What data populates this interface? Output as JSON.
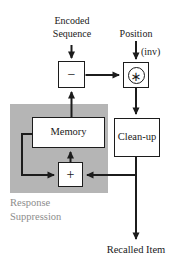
{
  "labels": {
    "encoded_sequence": "Encoded Sequence",
    "position": "Position",
    "inv": "(inv)",
    "response_suppression": "Response Suppression",
    "recalled_item": "Recalled Item"
  },
  "nodes": {
    "subtract": "−",
    "convolve": "∗",
    "memory": "Memory",
    "cleanup": "Clean-up",
    "add": "+"
  },
  "edges": [
    {
      "from": "encoded-sequence",
      "to": "subtract"
    },
    {
      "from": "position",
      "to": "convolve",
      "annotation": "(inv)"
    },
    {
      "from": "subtract",
      "to": "convolve"
    },
    {
      "from": "memory",
      "to": "subtract"
    },
    {
      "from": "convolve",
      "to": "cleanup"
    },
    {
      "from": "cleanup",
      "to": "recalled-item"
    },
    {
      "from": "cleanup",
      "to": "add"
    },
    {
      "from": "add",
      "to": "memory"
    },
    {
      "from": "memory",
      "to": "add"
    }
  ],
  "colors": {
    "shade_region": "#b5b5b5",
    "line": "#1c1c1c",
    "text": "#1a1a1a",
    "muted_text": "#8d8d8d",
    "box_background": "#ffffff"
  }
}
